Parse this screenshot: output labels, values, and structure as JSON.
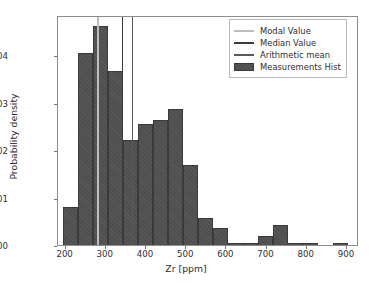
{
  "chart_data": {
    "type": "bar",
    "title": "",
    "xlabel": "Zr [ppm]",
    "ylabel": "Probability density",
    "xlim": [
      181,
      930
    ],
    "ylim": [
      0.0,
      0.00485
    ],
    "grid": false,
    "legend_position": "upper right",
    "xticks": [
      200,
      300,
      400,
      500,
      600,
      700,
      800,
      900
    ],
    "xticklabels": [
      "200",
      "300",
      "400",
      "500",
      "600",
      "700",
      "800",
      "900"
    ],
    "yticks": [
      0.0,
      0.001,
      0.002,
      0.003,
      0.004
    ],
    "yticklabels": [
      "0.000",
      "0.001",
      "0.002",
      "0.003",
      "0.004"
    ],
    "bin_width": 37.4,
    "bin_edges": [
      193,
      230.4,
      267.8,
      305.2,
      342.6,
      380,
      417.4,
      454.8,
      492.2,
      529.6,
      567,
      604.4,
      641.8,
      679.2,
      716.6,
      754,
      791.4,
      828.8,
      866.2,
      903.6
    ],
    "bin_centers": [
      211.7,
      249.1,
      286.5,
      323.9,
      361.3,
      398.7,
      436.1,
      473.5,
      510.9,
      548.3,
      585.7,
      623.1,
      660.5,
      697.9,
      735.3,
      772.7,
      810.1,
      847.5,
      884.9
    ],
    "values": [
      0.00081,
      0.00405,
      0.00462,
      0.00368,
      0.00221,
      0.00256,
      0.00263,
      0.00286,
      0.00168,
      0.00058,
      0.00035,
      5e-05,
      4e-05,
      0.0002,
      0.00042,
      5e-05,
      5e-05,
      0.0,
      5e-05
    ],
    "series": [
      {
        "name": "Measurements Hist",
        "type": "histogram",
        "color": "#4f4f4f"
      }
    ],
    "vlines": [
      {
        "name": "Modal Value",
        "x": 281,
        "color": "#bdbdbd",
        "width": 1.6
      },
      {
        "name": "Median Value",
        "x": 342,
        "color": "#3c3c3c",
        "width": 1.4
      },
      {
        "name": "Arithmetic mean",
        "x": 366,
        "color": "#5a5a5a",
        "width": 1.4
      }
    ]
  },
  "legend": {
    "entries": [
      {
        "label": "Modal Value",
        "kind": "line",
        "color": "#bdbdbd"
      },
      {
        "label": "Median Value",
        "kind": "line",
        "color": "#3c3c3c"
      },
      {
        "label": "Arithmetic mean",
        "kind": "line",
        "color": "#5a5a5a"
      },
      {
        "label": "Measurements Hist",
        "kind": "patch",
        "color": "#4f4f4f"
      }
    ]
  },
  "axes": {
    "xlabel": "Zr [ppm]",
    "ylabel": "Probability density"
  }
}
